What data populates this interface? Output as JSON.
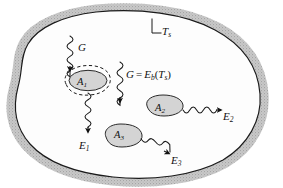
{
  "figure": {
    "type": "schematic-diagram",
    "background_color": "#ffffff",
    "enclosure": {
      "name": "isothermal enclosure surface",
      "wall_band_color": "#b8b8b8",
      "wall_outline_color": "#1a1a1a",
      "interior_fill": "#fdfdfd",
      "surface_label": "T",
      "surface_label_sub": "s",
      "leader_label_full": "Ts"
    },
    "incident_radiation": {
      "left_label": "G",
      "center_label_lhs": "G",
      "center_label_operator": "=",
      "center_label_rhs_main": "E",
      "center_label_rhs_sub": "b",
      "center_label_arg_open": "(",
      "center_label_arg_main": "T",
      "center_label_arg_sub": "s",
      "center_label_arg_close": ")",
      "center_label_full": "G = Eb(Ts)"
    },
    "bodies": [
      {
        "id": "A1",
        "label_main": "A",
        "label_sub": "1",
        "fill_color": "#d4d4d4",
        "outline_color": "#2a2a2a",
        "has_dashed_control_surface": true,
        "incident_label": "G",
        "emission_label_main": "E",
        "emission_label_sub": "1"
      },
      {
        "id": "A2",
        "label_main": "A",
        "label_sub": "2",
        "fill_color": "#d4d4d4",
        "outline_color": "#2a2a2a",
        "has_dashed_control_surface": false,
        "emission_label_main": "E",
        "emission_label_sub": "2"
      },
      {
        "id": "A3",
        "label_main": "A",
        "label_sub": "3",
        "fill_color": "#d4d4d4",
        "outline_color": "#2a2a2a",
        "has_dashed_control_surface": false,
        "emission_label_main": "E",
        "emission_label_sub": "3"
      }
    ],
    "emission_arrows": [
      {
        "from": "A1",
        "label": "E1",
        "direction": "down"
      },
      {
        "from": "A2",
        "label": "E2",
        "direction": "right"
      },
      {
        "from": "A3",
        "label": "E3",
        "direction": "right-down"
      }
    ],
    "incident_arrows": [
      {
        "to": "A1",
        "label": "G",
        "direction": "down"
      },
      {
        "to": "enclosure-interior",
        "label": "G = Eb(Ts)",
        "direction": "down"
      }
    ]
  }
}
